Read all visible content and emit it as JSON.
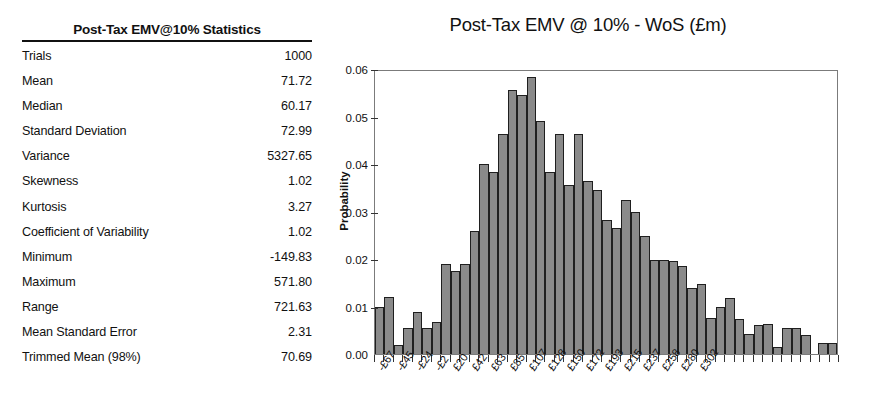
{
  "stats": {
    "title": "Post-Tax EMV@10% Statistics",
    "rows": [
      {
        "label": "Trials",
        "value": "1000"
      },
      {
        "label": "Mean",
        "value": "71.72"
      },
      {
        "label": "Median",
        "value": "60.17"
      },
      {
        "label": "Standard Deviation",
        "value": "72.99"
      },
      {
        "label": "Variance",
        "value": "5327.65"
      },
      {
        "label": "Skewness",
        "value": "1.02"
      },
      {
        "label": "Kurtosis",
        "value": "3.27"
      },
      {
        "label": "Coefficient of Variability",
        "value": "1.02"
      },
      {
        "label": "Minimum",
        "value": "-149.83"
      },
      {
        "label": "Maximum",
        "value": "571.80"
      },
      {
        "label": "Range",
        "value": "721.63"
      },
      {
        "label": "Mean Standard Error",
        "value": "2.31"
      },
      {
        "label": "Trimmed Mean (98%)",
        "value": "70.69"
      }
    ]
  },
  "chart_data": {
    "type": "bar",
    "title": "Post-Tax EMV @ 10% - WoS (£m)",
    "xlabel": "",
    "ylabel": "Probability",
    "ylim": [
      0,
      0.06
    ],
    "ytick_labels": [
      "0.00",
      "0.01",
      "0.02",
      "0.03",
      "0.04",
      "0.05",
      "0.06"
    ],
    "ytick_values": [
      0,
      0.01,
      0.02,
      0.03,
      0.04,
      0.05,
      0.06
    ],
    "grid": false,
    "legend": "none",
    "bar_color": "#8a8a8a",
    "bar_edge_color": "#1f1f1f",
    "xtick_labels": [
      "-£67",
      "-£45",
      "-£24",
      "-£2",
      "£20",
      "£42",
      "£63",
      "£85",
      "£107",
      "£128",
      "£150",
      "£172",
      "£193",
      "£215",
      "£237",
      "£258",
      "£280",
      "£302"
    ],
    "xtick_bar_indices": [
      0,
      2,
      4,
      6,
      8,
      10,
      12,
      14,
      16,
      18,
      20,
      22,
      24,
      26,
      28,
      30,
      32,
      34
    ],
    "values": [
      0.01,
      0.012,
      0.002,
      0.0055,
      0.0088,
      0.0055,
      0.0068,
      0.019,
      0.0175,
      0.019,
      0.026,
      0.04,
      0.0383,
      0.0463,
      0.0555,
      0.0545,
      0.0583,
      0.049,
      0.0383,
      0.0463,
      0.0355,
      0.0463,
      0.0365,
      0.0345,
      0.0283,
      0.0265,
      0.0325,
      0.0298,
      0.0248,
      0.0198,
      0.0198,
      0.0195,
      0.0185,
      0.014,
      0.0148,
      0.0075,
      0.01,
      0.0118,
      0.0073,
      0.0043,
      0.0062,
      0.0063,
      0.0015,
      0.0055,
      0.0055,
      0.004,
      0.0,
      0.0023,
      0.0023
    ]
  }
}
